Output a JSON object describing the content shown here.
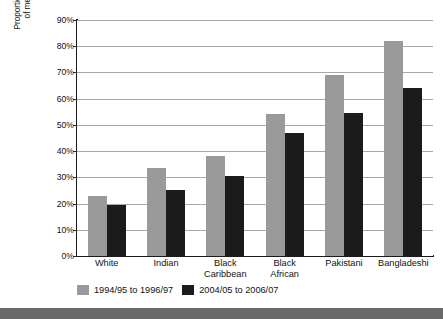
{
  "chart_data": {
    "type": "bar",
    "title": "",
    "xlabel": "",
    "ylabel": "Proportion of the population in households below 60% of median income after deducting housing costs",
    "ylabel_lines": [
      "Proportion of the population in households below 60%",
      "of median income after deducting housing costs"
    ],
    "categories": [
      "White",
      "Black Caribbean",
      "Black African",
      "Indian",
      "Pakistani",
      "Bangladeshi"
    ],
    "category_labels": [
      [
        "White"
      ],
      [
        "Indian"
      ],
      [
        "Black",
        "Caribbean"
      ],
      [
        "Black",
        "African"
      ],
      [
        "Pakistani"
      ],
      [
        "Bangladeshi"
      ]
    ],
    "category_order": [
      "White",
      "Indian",
      "Black Caribbean",
      "Black African",
      "Pakistani",
      "Bangladeshi"
    ],
    "series": [
      {
        "name": "1994/95 to 1996/97",
        "color": "#9a9a9a",
        "values": [
          23,
          33.5,
          38,
          54,
          69,
          82
        ]
      },
      {
        "name": "2004/05 to 2006/07",
        "color": "#1b1b1b",
        "values": [
          19.5,
          25,
          30.5,
          47,
          54.5,
          64
        ]
      }
    ],
    "ylim": [
      0,
      90
    ],
    "ytick_values": [
      0,
      10,
      20,
      30,
      40,
      50,
      60,
      70,
      80,
      90
    ],
    "ytick_labels": [
      "0%",
      "10%",
      "20%",
      "30%",
      "40%",
      "50%",
      "60%",
      "70%",
      "80%",
      "90%"
    ],
    "grid": true,
    "grid_color": "#a8a8a8",
    "legend_position": "bottom-left",
    "plot_background": "#ffffff",
    "axis_color": "#1a1a1a"
  },
  "legend": {
    "entries": [
      {
        "label": "1994/95 to 1996/97",
        "swatch": "legend-swatch-gray"
      },
      {
        "label": "2004/05 to 2006/07",
        "swatch": "legend-swatch-black"
      }
    ]
  },
  "page": {
    "bottom_strip_color": "#696969"
  }
}
